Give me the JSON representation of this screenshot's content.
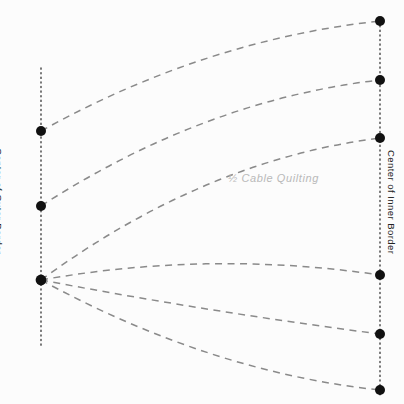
{
  "diagram": {
    "title_caption": "½  Cable Quilting",
    "left_axis_label": "Center of Outer Border",
    "right_axis_label": "Center of Inner Border",
    "background_color": "#fcfcfc",
    "dash_color": "#8a8a8a",
    "dot_color": "#111111",
    "dotted_guide_color": "#333333",
    "caption_color": "#b9b9b9",
    "left_guide": {
      "x": 41,
      "y_top": 68,
      "y_bottom": 348
    },
    "right_guide": {
      "x": 380,
      "y_top": 21,
      "y_bottom": 397
    },
    "left_nodes": [
      {
        "name": "left-node-1",
        "x": 41,
        "y": 131
      },
      {
        "name": "left-node-2",
        "x": 41,
        "y": 206
      },
      {
        "name": "left-node-3",
        "x": 41,
        "y": 280
      }
    ],
    "right_nodes": [
      {
        "name": "right-node-1",
        "x": 380,
        "y": 21
      },
      {
        "name": "right-node-2",
        "x": 380,
        "y": 80
      },
      {
        "name": "right-node-3",
        "x": 380,
        "y": 138
      },
      {
        "name": "right-node-4",
        "x": 380,
        "y": 275
      },
      {
        "name": "right-node-5",
        "x": 380,
        "y": 334
      },
      {
        "name": "right-node-6",
        "x": 380,
        "y": 390
      }
    ],
    "node_radius": 5,
    "curves": [
      {
        "name": "cable-curve-1",
        "from": [
          41,
          131
        ],
        "control": [
          205,
          40
        ],
        "to": [
          380,
          21
        ]
      },
      {
        "name": "cable-curve-2",
        "from": [
          41,
          206
        ],
        "control": [
          205,
          100
        ],
        "to": [
          380,
          80
        ]
      },
      {
        "name": "cable-curve-3",
        "from": [
          41,
          280
        ],
        "control": [
          205,
          160
        ],
        "to": [
          380,
          138
        ]
      },
      {
        "name": "cable-curve-4",
        "from": [
          41,
          280
        ],
        "control": [
          210,
          250
        ],
        "to": [
          380,
          275
        ]
      },
      {
        "name": "cable-curve-5",
        "from": [
          41,
          280
        ],
        "control": [
          210,
          312
        ],
        "to": [
          380,
          334
        ]
      },
      {
        "name": "cable-curve-6",
        "from": [
          41,
          280
        ],
        "control": [
          210,
          372
        ],
        "to": [
          380,
          390
        ]
      }
    ]
  }
}
